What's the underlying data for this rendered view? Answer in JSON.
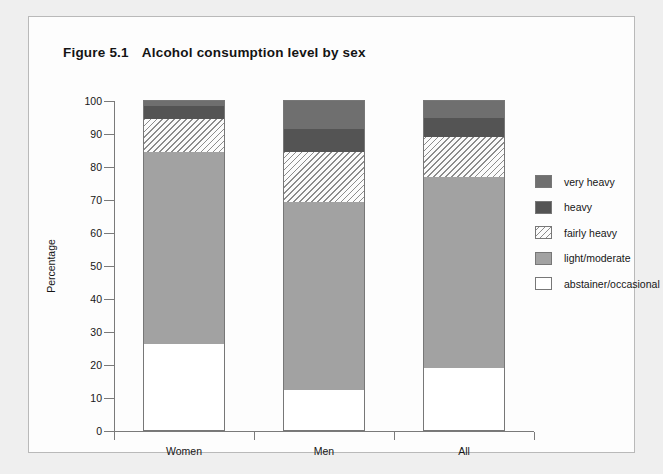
{
  "figure": {
    "number": "Figure 5.1",
    "title": "Alcohol consumption level by sex"
  },
  "chart_data": {
    "type": "bar",
    "stacked": true,
    "xlabel": "",
    "ylabel": "Percentage",
    "ylim": [
      0,
      100
    ],
    "ytick_step": 10,
    "grid": false,
    "legend_position": "right",
    "categories": [
      "Women",
      "Men",
      "All"
    ],
    "series": [
      {
        "name": "abstainer/occasional",
        "color": "#ffffff",
        "pattern": "solid",
        "values": [
          26.5,
          12.5,
          19.0
        ]
      },
      {
        "name": "light/moderate",
        "color": "#a2a2a2",
        "pattern": "solid",
        "values": [
          58.0,
          57.0,
          58.0
        ]
      },
      {
        "name": "fairly heavy",
        "color": "#fbfbfb",
        "pattern": "hatched",
        "values": [
          10.0,
          15.0,
          12.0
        ]
      },
      {
        "name": "heavy",
        "color": "#545454",
        "pattern": "solid",
        "values": [
          3.9,
          7.0,
          6.0
        ]
      },
      {
        "name": "very heavy",
        "color": "#6f6f6f",
        "pattern": "solid",
        "values": [
          1.6,
          8.5,
          5.0
        ]
      }
    ],
    "cumulative_tops": {
      "Women": {
        "abstainer/occasional": 26.5,
        "light/moderate": 84.5,
        "fairly heavy": 94.5,
        "heavy": 98.4,
        "very heavy": 100
      },
      "Men": {
        "abstainer/occasional": 12.5,
        "light/moderate": 69.5,
        "fairly heavy": 84.5,
        "heavy": 91.5,
        "very heavy": 100
      },
      "All": {
        "abstainer/occasional": 19.0,
        "light/moderate": 77.0,
        "fairly heavy": 89.0,
        "heavy": 95.0,
        "very heavy": 100
      }
    },
    "ytick_labels": [
      "0",
      "10",
      "20",
      "30",
      "40",
      "50",
      "60",
      "70",
      "80",
      "90",
      "100"
    ],
    "legend_entries": [
      "very heavy",
      "heavy",
      "fairly heavy",
      "light/moderate",
      "abstainer/occasional"
    ]
  }
}
